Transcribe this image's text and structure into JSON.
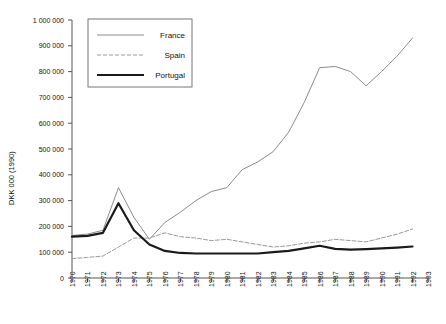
{
  "chart_data": {
    "type": "line",
    "title": "",
    "xlabel": "",
    "ylabel": "DKK 000 (1990)",
    "xlim": [
      1970,
      1993
    ],
    "ylim": [
      0,
      1000000
    ],
    "grid": false,
    "legend_position": "top-left-inside",
    "x": [
      1970,
      1971,
      1972,
      1973,
      1974,
      1975,
      1976,
      1977,
      1978,
      1979,
      1980,
      1981,
      1982,
      1983,
      1984,
      1985,
      1986,
      1987,
      1988,
      1989,
      1990,
      1991,
      1992
    ],
    "xtick_labels": [
      "1970",
      "1971",
      "1972",
      "1973",
      "1974",
      "1975",
      "1976",
      "1977",
      "1978",
      "1979",
      "1980",
      "1981",
      "1982",
      "1983",
      "1984",
      "1985",
      "1986",
      "1987",
      "1988",
      "1989",
      "1990",
      "1991",
      "1992",
      "1993"
    ],
    "ytick_labels": [
      "0",
      "100 000",
      "200 000",
      "300 000",
      "400 000",
      "500 000",
      "600 000",
      "700 000",
      "800 000",
      "900 000",
      "1 000 000"
    ],
    "ytick_values": [
      0,
      100000,
      200000,
      300000,
      400000,
      500000,
      600000,
      700000,
      800000,
      900000,
      1000000
    ],
    "series": [
      {
        "name": "France",
        "style": "thin-solid",
        "color": "#8c8c8c",
        "width": 1,
        "dash": "none",
        "values": [
          165000,
          170000,
          185000,
          350000,
          235000,
          150000,
          215000,
          255000,
          300000,
          335000,
          350000,
          420000,
          450000,
          490000,
          565000,
          680000,
          815000,
          820000,
          800000,
          745000,
          800000,
          860000,
          930000
        ]
      },
      {
        "name": "Spain",
        "style": "dashed",
        "color": "#9a9a9a",
        "width": 1,
        "dash": "4 2",
        "values": [
          75000,
          80000,
          85000,
          120000,
          155000,
          155000,
          175000,
          160000,
          155000,
          145000,
          150000,
          140000,
          130000,
          120000,
          125000,
          135000,
          140000,
          150000,
          145000,
          140000,
          155000,
          170000,
          190000
        ]
      },
      {
        "name": "Portugal",
        "style": "thick-solid",
        "color": "#1a1a1a",
        "width": 2.2,
        "dash": "none",
        "values": [
          160000,
          163000,
          175000,
          290000,
          185000,
          130000,
          105000,
          97000,
          95000,
          95000,
          95000,
          95000,
          95000,
          100000,
          105000,
          115000,
          125000,
          113000,
          110000,
          112000,
          115000,
          118000,
          122000
        ]
      }
    ]
  },
  "legend": {
    "items": [
      {
        "label": "France"
      },
      {
        "label": "Spain"
      },
      {
        "label": "Portugal"
      }
    ]
  }
}
